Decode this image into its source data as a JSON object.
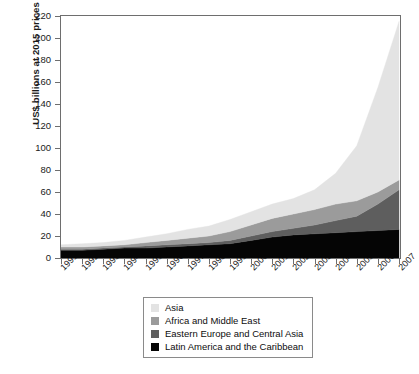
{
  "chart_data": {
    "type": "area",
    "stacked": true,
    "title": "",
    "subtitle": "",
    "xlabel": "",
    "ylabel": "US$ billions at 2015 prices",
    "ylim": [
      0,
      220
    ],
    "ytick_step": 20,
    "yticks": [
      0,
      20,
      40,
      60,
      80,
      100,
      120,
      140,
      160,
      180,
      200,
      220
    ],
    "grid": false,
    "legend_position": "below-center",
    "categories": [
      "1991",
      "1992",
      "1993",
      "1994",
      "1995",
      "1996",
      "1997",
      "1998",
      "1999",
      "2000",
      "2001",
      "2002",
      "2003",
      "2004",
      "2005",
      "2006",
      "2007"
    ],
    "x": [
      1991,
      1992,
      1993,
      1994,
      1995,
      1996,
      1997,
      1998,
      1999,
      2000,
      2001,
      2002,
      2003,
      2004,
      2005,
      2006,
      2007
    ],
    "stack_order_bottom_to_top": [
      "Latin America and the Caribbean",
      "Eastern Europe and Central Asia",
      "Africa and Middle East",
      "Asia"
    ],
    "series": [
      {
        "name": "Latin America and the Caribbean",
        "color": "#050505",
        "values": [
          7,
          7,
          8,
          9,
          9,
          10,
          11,
          12,
          13,
          16,
          19,
          21,
          22,
          23,
          24,
          25,
          26
        ]
      },
      {
        "name": "Eastern Europe and Central Asia",
        "color": "#5e5e5e",
        "values": [
          1,
          1,
          1,
          1,
          2,
          2,
          2,
          2,
          3,
          4,
          5,
          6,
          8,
          11,
          14,
          24,
          36
        ]
      },
      {
        "name": "Africa and Middle East",
        "color": "#9b9b9b",
        "values": [
          2,
          2,
          2,
          2,
          3,
          4,
          5,
          6,
          8,
          10,
          12,
          13,
          14,
          15,
          14,
          11,
          9
        ]
      },
      {
        "name": "Asia",
        "color": "#e3e3e3",
        "values": [
          2,
          3,
          3,
          4,
          5,
          6,
          8,
          9,
          11,
          12,
          13,
          14,
          18,
          28,
          50,
          95,
          144
        ]
      }
    ],
    "totals": [
      12,
      13,
      14,
      16,
      19,
      22,
      26,
      29,
      35,
      42,
      49,
      54,
      62,
      77,
      102,
      155,
      215
    ],
    "legend": [
      {
        "label": "Asia",
        "color": "#e3e3e3"
      },
      {
        "label": "Africa and Middle East",
        "color": "#9b9b9b"
      },
      {
        "label": "Eastern Europe and Central Asia",
        "color": "#5e5e5e"
      },
      {
        "label": "Latin America and the Caribbean",
        "color": "#050505"
      }
    ]
  },
  "footnote": ""
}
